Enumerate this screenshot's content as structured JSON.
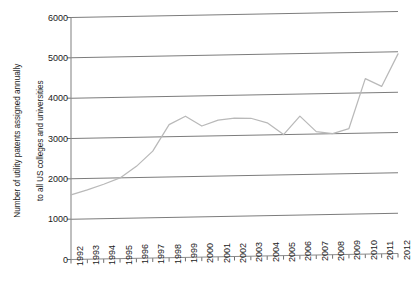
{
  "chart_data": {
    "type": "line",
    "title": "",
    "subtitle": "",
    "xlabel": "",
    "ylabel": "Number of utility patents assigned annually to all US colleges and universities",
    "ylabel_lines": [
      "Number of utility patents assigned annually",
      "to all US colleges and universities"
    ],
    "categories": [
      "1992",
      "1993",
      "1994",
      "1995",
      "1996",
      "1997",
      "1998",
      "1999",
      "2000",
      "2001",
      "2002",
      "2003",
      "2004",
      "2005",
      "2006",
      "2007",
      "2008",
      "2009",
      "2010",
      "2011",
      "2012"
    ],
    "x": [
      1992,
      1993,
      1994,
      1995,
      1996,
      1997,
      1998,
      1999,
      2000,
      2001,
      2002,
      2003,
      2004,
      2005,
      2006,
      2007,
      2008,
      2009,
      2010,
      2011,
      2012
    ],
    "values": [
      1600,
      1720,
      1850,
      2000,
      2280,
      2650,
      3300,
      3500,
      3250,
      3390,
      3430,
      3420,
      3300,
      3000,
      3450,
      3060,
      3000,
      3120,
      4350,
      4150,
      4950
    ],
    "series": [
      {
        "name": "Utility patents",
        "values": [
          1600,
          1720,
          1850,
          2000,
          2280,
          2650,
          3300,
          3500,
          3250,
          3390,
          3430,
          3420,
          3300,
          3000,
          3450,
          3060,
          3000,
          3120,
          4350,
          4150,
          4950
        ],
        "color": "#b9b9b9"
      }
    ],
    "ylim": [
      0,
      6000
    ],
    "yticks": [
      0,
      1000,
      2000,
      3000,
      4000,
      5000,
      6000
    ],
    "ytick_labels": [
      "0",
      "1000",
      "2000",
      "3000",
      "4000",
      "5000",
      "6000"
    ],
    "xlim": [
      1992,
      2012
    ],
    "grid": true,
    "grid_axis": "y",
    "legend": false,
    "legend_position": "none",
    "annotations": []
  },
  "style": {
    "grid_color": "#7c7c7c",
    "axis_color": "#8a8a8a",
    "line_color": "#b9b9b9",
    "text_color": "#1a1a1a",
    "background": "#ffffff"
  }
}
